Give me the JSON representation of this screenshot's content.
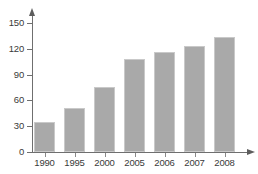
{
  "chart_data": {
    "type": "bar",
    "title": "",
    "xlabel": "",
    "ylabel": "",
    "categories": [
      "1990",
      "1995",
      "2000",
      "2005",
      "2006",
      "2007",
      "2008"
    ],
    "values": [
      35,
      51,
      76,
      108,
      116,
      123,
      134
    ],
    "ylim": [
      0,
      150
    ],
    "yticks": [
      0,
      30,
      60,
      90,
      120,
      150
    ],
    "ytick_labels": [
      "0",
      "30",
      "60",
      "90",
      "120",
      "150"
    ],
    "grid": false,
    "legend": null,
    "bar_color": "#a9a9a9",
    "axis_color": "#6f6f6f",
    "text_color": "#3a3a3a",
    "background": "#ffffff"
  }
}
